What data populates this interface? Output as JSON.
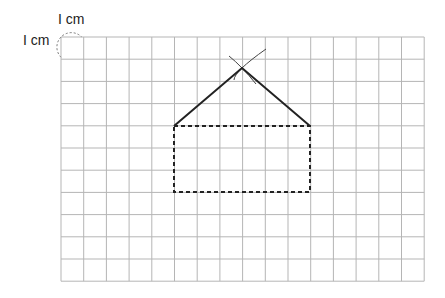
{
  "labels": {
    "top_unit": "I cm",
    "left_unit": "I cm"
  },
  "grid": {
    "columns": 16,
    "rows": 11,
    "origin_x": 61,
    "origin_y": 37,
    "cell_w": 22.7,
    "cell_h": 22.2,
    "line_color": "#b5b5b5"
  },
  "figure": {
    "name": "house",
    "rectangle": {
      "x1": 174,
      "y1": 126,
      "x2": 310,
      "y2": 192,
      "style": "dashed",
      "color": "#222222"
    },
    "roof": {
      "left": [
        174,
        126
      ],
      "apex": [
        242,
        68
      ],
      "right": [
        310,
        126
      ],
      "style": "solid",
      "color": "#222222"
    },
    "construction_arcs": [
      {
        "from": [
          229,
          56
        ],
        "via": [
          242,
          68
        ],
        "to": [
          256,
          84
        ]
      },
      {
        "from": [
          266,
          49
        ],
        "via": [
          242,
          68
        ],
        "to": [
          234,
          80
        ]
      }
    ]
  },
  "unit_marker": {
    "style": "dashed-circle",
    "cx": 72,
    "cy": 48,
    "r": 14
  }
}
